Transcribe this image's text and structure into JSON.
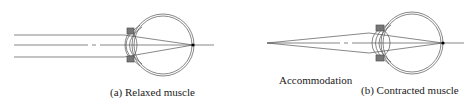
{
  "figure": {
    "panels": [
      {
        "id": "a",
        "caption": "(a) Relaxed muscle",
        "state": "relaxed",
        "light_source": "parallel rays from distant object"
      },
      {
        "id": "b",
        "caption": "(b) Contracted muscle",
        "state": "contracted",
        "light_source": "diverging rays from near point"
      }
    ],
    "annotation": "Accommodation",
    "colors": {
      "line": "#555555",
      "muscle": "#666666",
      "focus_point": "#000000"
    }
  }
}
